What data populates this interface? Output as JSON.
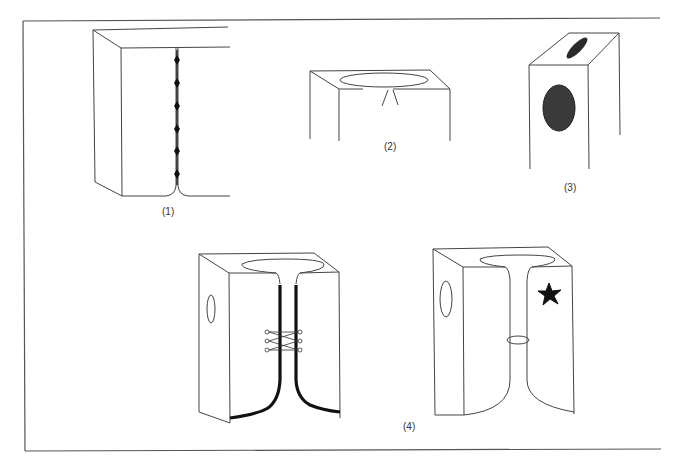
{
  "figure": {
    "panels": [
      {
        "id": 1,
        "label": "(1)",
        "description": "Block with vertical seam closed by a line of stitches/pins"
      },
      {
        "id": 2,
        "label": "(2)",
        "description": "Block top with oval opening and a small inverted-V notch below it"
      },
      {
        "id": 3,
        "label": "(3)",
        "description": "Narrow block with dark shaded oval on top face and front face"
      },
      {
        "id": 4,
        "label": "(4)",
        "description": "Two blocks with funnel-shaped channels: left with thick-edged slit and laced pins, right with ring around the channel and a star marker"
      }
    ]
  },
  "colors": {
    "line": "#444444",
    "frame": "#555555",
    "fill_dark": "#1a1a1a",
    "fill_shaded": "#3a3a3a",
    "background": "#ffffff"
  }
}
